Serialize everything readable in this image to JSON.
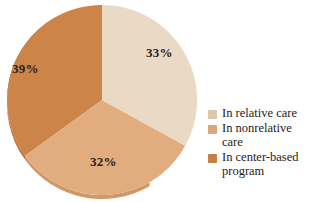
{
  "chart_data": {
    "type": "pie",
    "title": "",
    "subtitle": "",
    "xlabel": "",
    "ylabel": "",
    "legend_position": "right",
    "grid": false,
    "categories": [
      "In relative care",
      "In nonrelative care",
      "In center-based program"
    ],
    "values": [
      33,
      32,
      39
    ],
    "value_labels": [
      "33%",
      "32%",
      "39%"
    ],
    "colors": [
      "#ead9c4",
      "#e2ad7e",
      "#cd8449"
    ],
    "start_angle_deg": 0,
    "direction": "clockwise",
    "slices": [
      {
        "label": "In relative care",
        "value": 33,
        "value_label": "33%",
        "color": "#ead9c4",
        "start_deg": 0,
        "end_deg": 118.8
      },
      {
        "label": "In nonrelative care",
        "value": 32,
        "value_label": "32%",
        "color": "#e2ad7e",
        "start_deg": 118.8,
        "end_deg": 234
      },
      {
        "label": "In center-based program",
        "value": 39,
        "value_label": "39%",
        "color": "#cd8449",
        "start_deg": 234,
        "end_deg": 360
      }
    ]
  },
  "pie": {
    "labels": {
      "relative_pct": "33%",
      "nonrelative_pct": "32%",
      "center_pct": "39%"
    }
  },
  "legend": {
    "items": [
      {
        "label": "In relative care",
        "color": "#ddc7a9"
      },
      {
        "label": "In nonrelative care",
        "color": "#dba777"
      },
      {
        "label": "In center-based program",
        "color": "#c67f47"
      }
    ]
  },
  "colors": {
    "background": "#ffffff",
    "slice_relative": "#ead9c4",
    "slice_nonrelative": "#e2ad7e",
    "slice_center": "#cd8449",
    "rim_relative": "#d7c2a6",
    "rim_nonrelative": "#cf9866",
    "rim_center": "#b9733b",
    "label_text": "#2b2118",
    "legend_text": "#1f1a16"
  }
}
